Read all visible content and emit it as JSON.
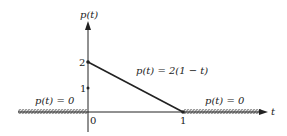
{
  "diagram": {
    "y_axis_label": "p(t)",
    "x_axis_label": "t",
    "y_ticks": [
      "2",
      "1"
    ],
    "x_ticks": [
      "0",
      "1"
    ],
    "formula_middle": "p(t) = 2(1 − t)",
    "formula_left": "p(t) = 0",
    "formula_right": "p(t) = 0",
    "colors": {
      "ink": "#222222",
      "background": "#ffffff"
    }
  }
}
